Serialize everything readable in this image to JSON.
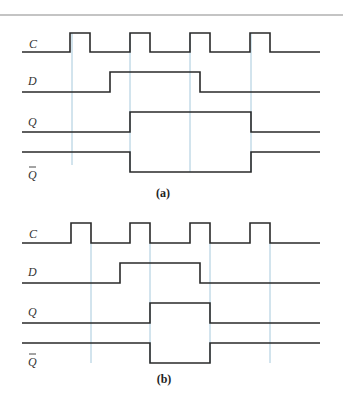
{
  "figure": {
    "panels": [
      {
        "caption": "(a)",
        "signals": [
          {
            "name": "C",
            "label": "C",
            "overbar": false
          },
          {
            "name": "D",
            "label": "D",
            "overbar": false
          },
          {
            "name": "Q",
            "label": "Q",
            "overbar": false
          },
          {
            "name": "Qbar",
            "label": "Q",
            "overbar": true
          }
        ],
        "trigger": "rising-edge",
        "guide_x": [
          72,
          130,
          190,
          251
        ]
      },
      {
        "caption": "(b)",
        "signals": [
          {
            "name": "C",
            "label": "C",
            "overbar": false
          },
          {
            "name": "D",
            "label": "D",
            "overbar": false
          },
          {
            "name": "Q",
            "label": "Q",
            "overbar": false
          },
          {
            "name": "Qbar",
            "label": "Q",
            "overbar": true
          }
        ],
        "trigger": "falling-edge",
        "guide_x": [
          91,
          150,
          210,
          270
        ]
      }
    ]
  },
  "colors": {
    "signal": "#2a2a2a",
    "guide": "#9cc3d8",
    "rule": "#8a8a8a"
  }
}
